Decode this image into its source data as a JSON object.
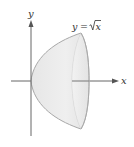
{
  "figure": {
    "curve_label": {
      "lhs": "y",
      "eq": "=",
      "radicand": "x"
    },
    "axes": {
      "x_label": "x",
      "y_label": "y"
    },
    "colors": {
      "axis": "#555555",
      "surface_fill": "#ebebeb",
      "surface_edge": "#a8a8a8",
      "rim_fill": "#f3f3f3",
      "text": "#333333"
    }
  }
}
